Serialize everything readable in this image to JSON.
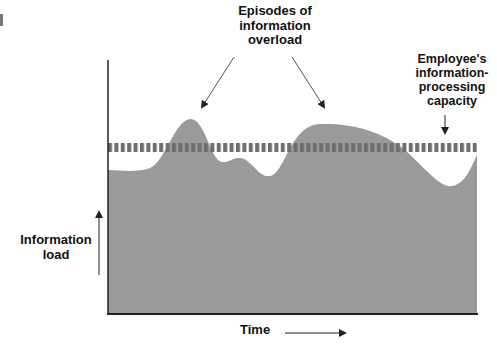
{
  "diagram": {
    "annotations": {
      "episodes": "Episodes of information overload",
      "episodes_lines": [
        "Episodes of",
        "information",
        "overload"
      ],
      "capacity": "Employee's information-processing capacity",
      "capacity_lines": [
        "Employee's",
        "information-",
        "processing",
        "capacity"
      ]
    },
    "axes": {
      "y_label_lines": [
        "Information",
        "load"
      ],
      "x_label": "Time"
    },
    "colors": {
      "area_fill": "#9a9a9a",
      "capacity_band": "#6e6e6e",
      "axis": "#222222",
      "text": "#111111"
    }
  }
}
